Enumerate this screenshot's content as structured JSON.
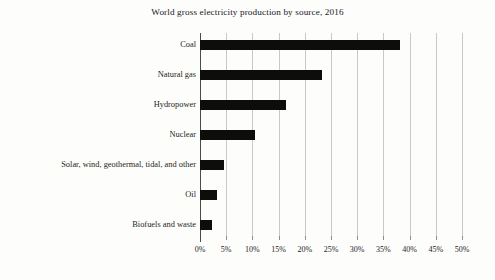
{
  "chart_data": {
    "type": "bar",
    "orientation": "horizontal",
    "title": "World gross electricity production by source, 2016",
    "xlabel": "",
    "ylabel": "",
    "categories": [
      "Coal",
      "Natural gas",
      "Hydropower",
      "Nuclear",
      "Solar, wind, geothermal, tidal, and other",
      "Oil",
      "Biofuels and waste"
    ],
    "values": [
      38.2,
      23.3,
      16.5,
      10.5,
      4.6,
      3.2,
      2.3
    ],
    "value_unit": "%",
    "xlim": [
      0,
      50
    ],
    "xticks": [
      0,
      5,
      10,
      15,
      20,
      25,
      30,
      35,
      40,
      45,
      50
    ],
    "xtick_labels": [
      "0%",
      "5%",
      "10%",
      "15%",
      "20%",
      "25%",
      "30%",
      "35%",
      "40%",
      "45%",
      "50%"
    ],
    "grid": true,
    "grid_axis": "x",
    "legend": false,
    "bar_color": "#0d0d0c",
    "gridline_color": "#c9c9c6",
    "axis_color": "#4a4a46",
    "background_color": "#fdfdfc"
  }
}
